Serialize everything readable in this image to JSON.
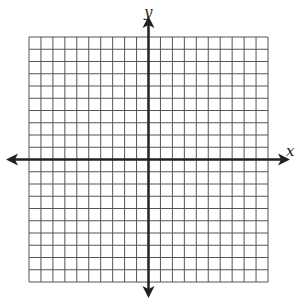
{
  "graph": {
    "x_label": "x",
    "y_label": "y",
    "grid_cells_x": 20,
    "grid_cells_y": 20,
    "x_range": [
      -10,
      10
    ],
    "y_range": [
      -10,
      10
    ],
    "grid_color": "#555555",
    "axis_color": "#222222"
  }
}
